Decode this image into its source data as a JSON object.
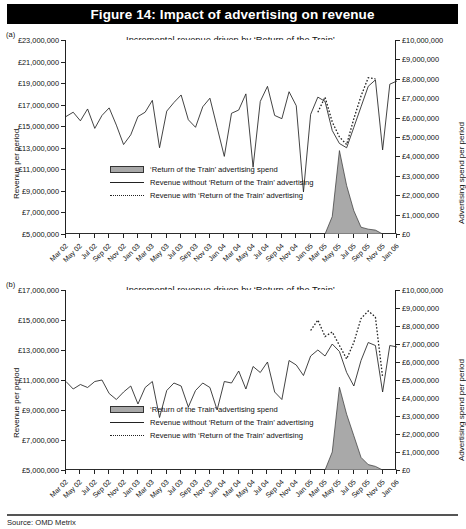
{
  "figure": {
    "banner_title": "Figure 14: Impact of advertising on revenue",
    "source": "Source: OMD Metrix"
  },
  "legend_labels": {
    "spend": "‘Return of the Train’ advertising spend",
    "without": "Revenue without ‘Return of the Train’ advertising",
    "with": "Revenue with ‘Return of the Train’ advertising"
  },
  "panel_a": {
    "letter": "(a)",
    "title_line1": "Incremental revenue driven by ‘Return of the Train’",
    "title_line2": "advertising – West Coast Business",
    "left_axis_title": "Revenue per period",
    "right_axis_title": "Advertising spend per period"
  },
  "panel_b": {
    "letter": "(b)",
    "title_line1": "Incremental revenue driven by ‘Return of the Train’",
    "title_line2": "advertising – West Coast Leisure",
    "left_axis_title": "Revenue per period",
    "right_axis_title": "Advertising spend per period"
  },
  "chart_data": [
    {
      "id": "panel-a",
      "type": "line",
      "title": "Incremental revenue driven by ‘Return of the Train’ advertising – West Coast Business",
      "xlabel": "",
      "ylabel": "Revenue per period",
      "y2label": "Advertising spend per period",
      "ylim": [
        5000000,
        23000000
      ],
      "y2lim": [
        0,
        10000000
      ],
      "yticks": [
        5000000,
        7000000,
        9000000,
        11000000,
        13000000,
        15000000,
        17000000,
        19000000,
        21000000,
        23000000
      ],
      "ytick_labels": [
        "£5,000,000",
        "£7,000,000",
        "£9,000,000",
        "£11,000,000",
        "£13,000,000",
        "£15,000,000",
        "£17,000,000",
        "£19,000,000",
        "£21,000,000",
        "£23,000,000"
      ],
      "y2ticks": [
        0,
        1000000,
        2000000,
        3000000,
        4000000,
        5000000,
        6000000,
        7000000,
        8000000,
        9000000,
        10000000
      ],
      "y2tick_labels": [
        "£0",
        "£1,000,000",
        "£2,000,000",
        "£3,000,000",
        "£4,000,000",
        "£5,000,000",
        "£6,000,000",
        "£7,000,000",
        "£8,000,000",
        "£9,000,000",
        "£10,000,000"
      ],
      "grid": false,
      "legend_position": "inside-lower-left",
      "x": [
        "Mar 02",
        "Apr 02",
        "May 02",
        "Jun 02",
        "Jul 02",
        "Aug 02",
        "Sep 02",
        "Oct 02",
        "Nov 02",
        "Dec 02",
        "Jan 03",
        "Feb 03",
        "Mar 03",
        "Apr 03",
        "May 03",
        "Jun 03",
        "Jul 03",
        "Aug 03",
        "Sep 03",
        "Oct 03",
        "Nov 03",
        "Dec 03",
        "Jan 04",
        "Feb 04",
        "Mar 04",
        "Apr 04",
        "May 04",
        "Jun 04",
        "Jul 04",
        "Aug 04",
        "Sep 04",
        "Oct 04",
        "Nov 04",
        "Dec 04",
        "Jan 05",
        "Feb 05",
        "Mar 05",
        "Apr 05",
        "May 05",
        "Jun 05",
        "Jul 05",
        "Aug 05",
        "Sep 05",
        "Oct 05",
        "Nov 05",
        "Dec 05",
        "Jan 06"
      ],
      "xtick_labels": [
        "Mar 02",
        "May 02",
        "Jul 02",
        "Sep 02",
        "Nov 02",
        "Jan 03",
        "Mar 03",
        "May 03",
        "Jul 03",
        "Sep 03",
        "Nov 03",
        "Jan 04",
        "Mar 04",
        "May 04",
        "Jul 04",
        "Sep 04",
        "Nov 04",
        "Jan 05",
        "Mar 05",
        "May 05",
        "Jul 05",
        "Sep 05",
        "Nov 05",
        "Jan 06"
      ],
      "series": [
        {
          "name": "Revenue without ‘Return of the Train’ advertising",
          "style": "solid",
          "axis": "left",
          "values": [
            15900000,
            16300000,
            15500000,
            16600000,
            14800000,
            16000000,
            16700000,
            15100000,
            13300000,
            14200000,
            15900000,
            16300000,
            17400000,
            13000000,
            16400000,
            17200000,
            17900000,
            15600000,
            14900000,
            16800000,
            17600000,
            14900000,
            12200000,
            16200000,
            16500000,
            18000000,
            11200000,
            17300000,
            18700000,
            16000000,
            15700000,
            18200000,
            16900000,
            8900000,
            16100000,
            17700000,
            17300000,
            14600000,
            13400000,
            13000000,
            14900000,
            16800000,
            18700000,
            19300000,
            12800000,
            18900000,
            19200000
          ]
        },
        {
          "name": "Revenue with ‘Return of the Train’ advertising",
          "style": "dotted",
          "axis": "left",
          "values": [
            null,
            null,
            null,
            null,
            null,
            null,
            null,
            null,
            null,
            null,
            null,
            null,
            null,
            null,
            null,
            null,
            null,
            null,
            null,
            null,
            null,
            null,
            null,
            null,
            null,
            null,
            null,
            null,
            null,
            null,
            null,
            null,
            null,
            null,
            null,
            16300000,
            17700000,
            15400000,
            14000000,
            13300000,
            15700000,
            17800000,
            19500000,
            19400000,
            null,
            null,
            null
          ]
        },
        {
          "name": "‘Return of the Train’ advertising spend",
          "style": "filled-area",
          "axis": "right",
          "values": [
            0,
            0,
            0,
            0,
            0,
            0,
            0,
            0,
            0,
            0,
            0,
            0,
            0,
            0,
            0,
            0,
            0,
            0,
            0,
            0,
            0,
            0,
            0,
            0,
            0,
            0,
            0,
            0,
            0,
            0,
            0,
            0,
            0,
            0,
            0,
            0,
            0,
            900000,
            4300000,
            2500000,
            1200000,
            350000,
            250000,
            200000,
            0,
            0,
            0
          ]
        }
      ]
    },
    {
      "id": "panel-b",
      "type": "line",
      "title": "Incremental revenue driven by ‘Return of the Train’ advertising – West Coast Leisure",
      "xlabel": "",
      "ylabel": "Revenue per period",
      "y2label": "Advertising spend per period",
      "ylim": [
        5000000,
        17000000
      ],
      "y2lim": [
        0,
        10000000
      ],
      "yticks": [
        5000000,
        7000000,
        9000000,
        11000000,
        13000000,
        15000000,
        17000000
      ],
      "ytick_labels": [
        "£5,000,000",
        "£7,000,000",
        "£9,000,000",
        "£11,000,000",
        "£13,000,000",
        "£15,000,000",
        "£17,000,000"
      ],
      "y2ticks": [
        0,
        1000000,
        2000000,
        3000000,
        4000000,
        5000000,
        6000000,
        7000000,
        8000000,
        9000000,
        10000000
      ],
      "y2tick_labels": [
        "£0",
        "£1,000,000",
        "£2,000,000",
        "£3,000,000",
        "£4,000,000",
        "£5,000,000",
        "£6,000,000",
        "£7,000,000",
        "£8,000,000",
        "£9,000,000",
        "£10,000,000"
      ],
      "grid": false,
      "legend_position": "inside-lower-left",
      "x": [
        "Mar 02",
        "Apr 02",
        "May 02",
        "Jun 02",
        "Jul 02",
        "Aug 02",
        "Sep 02",
        "Oct 02",
        "Nov 02",
        "Dec 02",
        "Jan 03",
        "Feb 03",
        "Mar 03",
        "Apr 03",
        "May 03",
        "Jun 03",
        "Jul 03",
        "Aug 03",
        "Sep 03",
        "Oct 03",
        "Nov 03",
        "Dec 03",
        "Jan 04",
        "Feb 04",
        "Mar 04",
        "Apr 04",
        "May 04",
        "Jun 04",
        "Jul 04",
        "Aug 04",
        "Sep 04",
        "Oct 04",
        "Nov 04",
        "Dec 04",
        "Jan 05",
        "Feb 05",
        "Mar 05",
        "Apr 05",
        "May 05",
        "Jun 05",
        "Jul 05",
        "Aug 05",
        "Sep 05",
        "Oct 05",
        "Nov 05",
        "Dec 05",
        "Jan 06"
      ],
      "xtick_labels": [
        "Mar 02",
        "May 02",
        "Jul 02",
        "Sep 02",
        "Nov 02",
        "Jan 03",
        "Mar 03",
        "May 03",
        "Jul 03",
        "Sep 03",
        "Nov 03",
        "Jan 04",
        "Mar 04",
        "May 04",
        "Jul 04",
        "Sep 04",
        "Nov 04",
        "Jan 05",
        "Mar 05",
        "May 05",
        "Jul 05",
        "Sep 05",
        "Nov 05",
        "Jan 06"
      ],
      "series": [
        {
          "name": "Revenue without ‘Return of the Train’ advertising",
          "style": "solid",
          "axis": "left",
          "values": [
            10900000,
            10400000,
            10700000,
            10500000,
            10900000,
            11000000,
            10100000,
            9700000,
            10200000,
            10600000,
            9400000,
            10500000,
            10900000,
            8500000,
            10300000,
            10800000,
            10600000,
            9200000,
            10300000,
            10800000,
            10500000,
            9000000,
            10900000,
            10800000,
            11600000,
            10400000,
            11900000,
            11500000,
            12200000,
            10200000,
            9700000,
            12300000,
            12000000,
            11300000,
            12600000,
            13000000,
            12600000,
            13400000,
            12900000,
            11500000,
            10600000,
            12300000,
            13500000,
            13300000,
            10200000,
            13300000,
            13200000
          ]
        },
        {
          "name": "Revenue with ‘Return of the Train’ advertising",
          "style": "dotted",
          "axis": "left",
          "values": [
            null,
            null,
            null,
            null,
            null,
            null,
            null,
            null,
            null,
            null,
            null,
            null,
            null,
            null,
            null,
            null,
            null,
            null,
            null,
            null,
            null,
            null,
            null,
            null,
            null,
            null,
            null,
            null,
            null,
            null,
            null,
            null,
            null,
            null,
            14300000,
            15000000,
            13900000,
            14200000,
            13300000,
            12400000,
            13500000,
            15100000,
            15600000,
            15200000,
            11200000,
            null,
            null
          ]
        },
        {
          "name": "‘Return of the Train’ advertising spend",
          "style": "filled-area",
          "axis": "right",
          "values": [
            0,
            0,
            0,
            0,
            0,
            0,
            0,
            0,
            0,
            0,
            0,
            0,
            0,
            0,
            0,
            0,
            0,
            0,
            0,
            0,
            0,
            0,
            0,
            0,
            0,
            0,
            0,
            0,
            0,
            0,
            0,
            0,
            0,
            0,
            0,
            0,
            0,
            1000000,
            4600000,
            3100000,
            1900000,
            700000,
            300000,
            200000,
            0,
            0,
            0
          ]
        }
      ]
    }
  ]
}
